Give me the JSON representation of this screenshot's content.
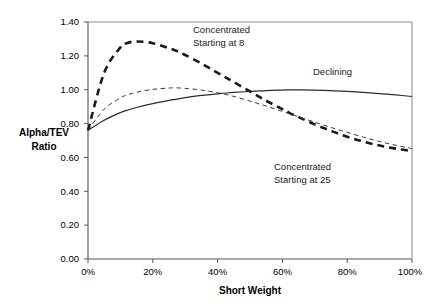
{
  "chart_data": {
    "type": "line",
    "title": "",
    "xlabel": "Short Weight",
    "ylabel": "Alpha/TEV Ratio",
    "xlim": [
      0,
      100
    ],
    "ylim": [
      0.0,
      1.4
    ],
    "grid": false,
    "legend_position": "inline-annotations",
    "x_tick_labels": [
      "0%",
      "20%",
      "40%",
      "60%",
      "80%",
      "100%"
    ],
    "x_tick_values": [
      0,
      20,
      40,
      60,
      80,
      100
    ],
    "y_tick_labels": [
      "0.00",
      "0.20",
      "0.40",
      "0.60",
      "0.80",
      "1.00",
      "1.20",
      "1.40"
    ],
    "y_tick_values": [
      0.0,
      0.2,
      0.4,
      0.6,
      0.8,
      1.0,
      1.2,
      1.4
    ],
    "x": [
      0,
      5,
      10,
      12,
      15,
      20,
      25,
      27,
      30,
      35,
      40,
      42,
      45,
      50,
      55,
      60,
      62,
      65,
      70,
      75,
      80,
      85,
      90,
      95,
      100
    ],
    "series": [
      {
        "name": "Declining",
        "style": "solid",
        "annotation": "Declining",
        "values": [
          0.76,
          0.82,
          0.865,
          0.878,
          0.895,
          0.918,
          0.937,
          0.943,
          0.953,
          0.966,
          0.976,
          0.979,
          0.984,
          0.99,
          0.995,
          0.998,
          0.999,
          0.999,
          0.998,
          0.995,
          0.99,
          0.984,
          0.977,
          0.969,
          0.96
        ]
      },
      {
        "name": "Concentrated Starting at 8",
        "style": "bold-dashed",
        "annotation_line1": "Concentrated",
        "annotation_line2": "Starting at 8",
        "values": [
          0.76,
          1.1,
          1.25,
          1.275,
          1.285,
          1.275,
          1.245,
          1.232,
          1.205,
          1.155,
          1.1,
          1.078,
          1.045,
          0.99,
          0.935,
          0.885,
          0.865,
          0.838,
          0.795,
          0.757,
          0.722,
          0.694,
          0.67,
          0.652,
          0.638
        ]
      },
      {
        "name": "Concentrated Starting at 25",
        "style": "thin-dashed",
        "annotation_line1": "Concentrated",
        "annotation_line2": "Starting at 25",
        "values": [
          0.76,
          0.885,
          0.952,
          0.968,
          0.985,
          1.002,
          1.01,
          1.011,
          1.008,
          0.998,
          0.982,
          0.974,
          0.96,
          0.933,
          0.903,
          0.872,
          0.859,
          0.84,
          0.808,
          0.777,
          0.748,
          0.72,
          0.694,
          0.672,
          0.652
        ]
      }
    ],
    "annotations": [
      {
        "id": "ann-conc8",
        "line1": "Concentrated",
        "line2": "Starting at 8"
      },
      {
        "id": "ann-declining",
        "line1": "Declining",
        "line2": ""
      },
      {
        "id": "ann-conc25",
        "line1": "Concentrated",
        "line2": "Starting at 25"
      }
    ]
  }
}
